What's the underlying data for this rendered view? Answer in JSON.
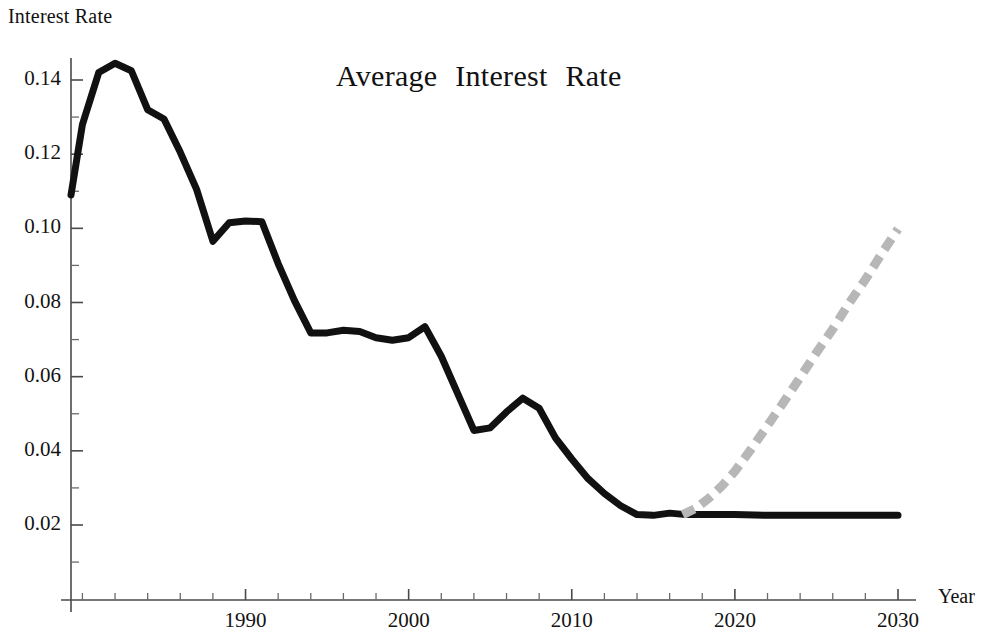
{
  "chart_data": {
    "type": "line",
    "title": "Average  Interest  Rate",
    "xlabel": "Year",
    "ylabel": "Interest Rate",
    "xlim": [
      1979.3,
      2030
    ],
    "ylim": [
      0.0,
      0.1505
    ],
    "grid": false,
    "legend": "none",
    "x_ticks_major": [
      1990,
      2000,
      2010,
      2020,
      2030
    ],
    "x_tick_labels": [
      "1990",
      "2000",
      "2010",
      "2020",
      "2030"
    ],
    "x_ticks_minor": [
      1980,
      1982,
      1984,
      1986,
      1988,
      1992,
      1994,
      1996,
      1998,
      2002,
      2004,
      2006,
      2008,
      2012,
      2014,
      2016,
      2018,
      2022,
      2024,
      2026,
      2028
    ],
    "y_ticks_major": [
      0.02,
      0.04,
      0.06,
      0.08,
      0.1,
      0.12,
      0.14
    ],
    "y_tick_labels": [
      "0.02",
      "0.04",
      "0.06",
      "0.08",
      "0.10",
      "0.12",
      "0.14"
    ],
    "y_ticks_minor": [
      0.01,
      0.03,
      0.05,
      0.07,
      0.09,
      0.11,
      0.13,
      0.15
    ],
    "series": [
      {
        "name": "Average Interest Rate (historical)",
        "style": "solid",
        "color": "#111111",
        "x": [
          1979.3,
          1980,
          1981,
          1982,
          1983,
          1984,
          1985,
          1986,
          1987,
          1988,
          1989,
          1990,
          1991,
          1992,
          1993,
          1994,
          1995,
          1996,
          1997,
          1998,
          1999,
          2000,
          2001,
          2002,
          2003,
          2004,
          2005,
          2006,
          2007,
          2008,
          2009,
          2010,
          2011,
          2012,
          2013,
          2014,
          2015,
          2016,
          2017,
          2018,
          2020,
          2022,
          2024,
          2026,
          2028,
          2030
        ],
        "y": [
          0.109,
          0.128,
          0.142,
          0.1445,
          0.1425,
          0.132,
          0.1295,
          0.1205,
          0.1105,
          0.0965,
          0.1015,
          0.102,
          0.1018,
          0.0905,
          0.0805,
          0.0718,
          0.0718,
          0.0725,
          0.0722,
          0.0705,
          0.0698,
          0.0705,
          0.0735,
          0.0655,
          0.0555,
          0.0455,
          0.0462,
          0.0505,
          0.0542,
          0.0515,
          0.0435,
          0.0378,
          0.0325,
          0.0285,
          0.0252,
          0.0228,
          0.0226,
          0.0232,
          0.0228,
          0.0228,
          0.0228,
          0.0226,
          0.0226,
          0.0226,
          0.0226,
          0.0226
        ]
      },
      {
        "name": "Average Interest Rate (projection)",
        "style": "dashed",
        "color": "#b7b7b7",
        "x": [
          2016.8,
          2017.6,
          2018.4,
          2019.2,
          2020,
          2021,
          2022,
          2023,
          2024,
          2025,
          2026,
          2027,
          2028,
          2029,
          2030
        ],
        "y": [
          0.0228,
          0.0245,
          0.0272,
          0.0305,
          0.0345,
          0.0405,
          0.0468,
          0.0532,
          0.0598,
          0.0665,
          0.0728,
          0.0798,
          0.0862,
          0.0932,
          0.0998
        ]
      }
    ]
  }
}
